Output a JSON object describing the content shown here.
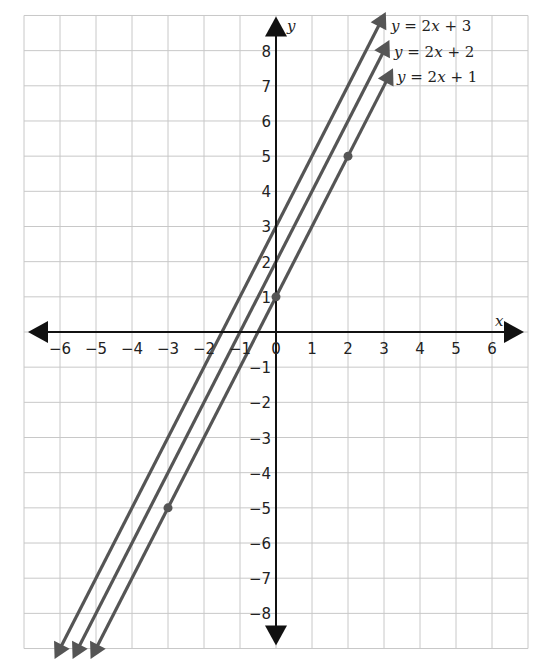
{
  "chart_data": {
    "type": "line",
    "title": "",
    "xlabel": "x",
    "ylabel": "y",
    "xlim": [
      -7,
      7
    ],
    "ylim": [
      -9,
      9
    ],
    "grid": true,
    "x_ticks": [
      "-6",
      "-5",
      "-4",
      "-3",
      "-2",
      "-1",
      "0",
      "1",
      "2",
      "3",
      "4",
      "5",
      "6"
    ],
    "y_ticks": [
      "8",
      "7",
      "6",
      "5",
      "4",
      "3",
      "2",
      "1",
      "-1",
      "-2",
      "-3",
      "-4",
      "-5",
      "-6",
      "-7",
      "-8"
    ],
    "series": [
      {
        "name": "y = 2x + 3",
        "slope": 2,
        "intercept": 3,
        "x_range": [
          -6.15,
          3.05
        ],
        "points": []
      },
      {
        "name": "y = 2x + 2",
        "slope": 2,
        "intercept": 2,
        "x_range": [
          -5.65,
          3.15
        ],
        "points": []
      },
      {
        "name": "y = 2x + 1",
        "slope": 2,
        "intercept": 1,
        "x_range": [
          -5.15,
          3.25
        ],
        "points": [
          [
            0,
            1
          ],
          [
            2,
            5
          ],
          [
            -3,
            -5
          ]
        ]
      }
    ],
    "legend": {
      "position": "top-right",
      "entries": [
        {
          "lhs": "y",
          "rhs_coef": "2",
          "rhs_var": "x",
          "op": "+",
          "const": "3"
        },
        {
          "lhs": "y",
          "rhs_coef": "2",
          "rhs_var": "x",
          "op": "+",
          "const": "2"
        },
        {
          "lhs": "y",
          "rhs_coef": "2",
          "rhs_var": "x",
          "op": "+",
          "const": "1"
        }
      ]
    },
    "colors": {
      "line": "#555555",
      "axis": "#111111",
      "grid": "#c8c8c8",
      "point": "#555555"
    }
  }
}
